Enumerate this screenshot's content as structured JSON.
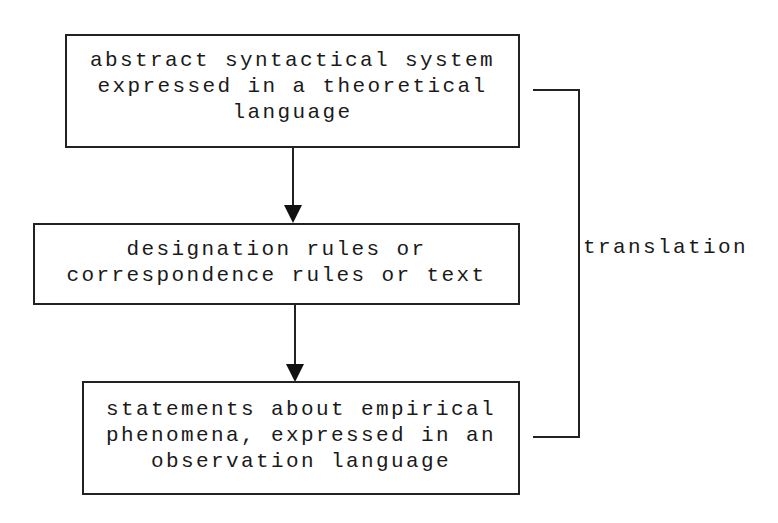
{
  "diagram": {
    "boxes": [
      {
        "id": "theoretical",
        "lines": [
          "abstract syntactical system",
          "expressed in a theoretical",
          "language"
        ]
      },
      {
        "id": "rules",
        "lines": [
          "designation rules or",
          "correspondence rules or text"
        ]
      },
      {
        "id": "observational",
        "lines": [
          "statements about empirical",
          "phenomena, expressed in an",
          "observation language"
        ]
      }
    ],
    "bracket_label": "translation",
    "colors": {
      "stroke": "#222222",
      "background": "#ffffff",
      "text": "#1a1a1a"
    }
  }
}
